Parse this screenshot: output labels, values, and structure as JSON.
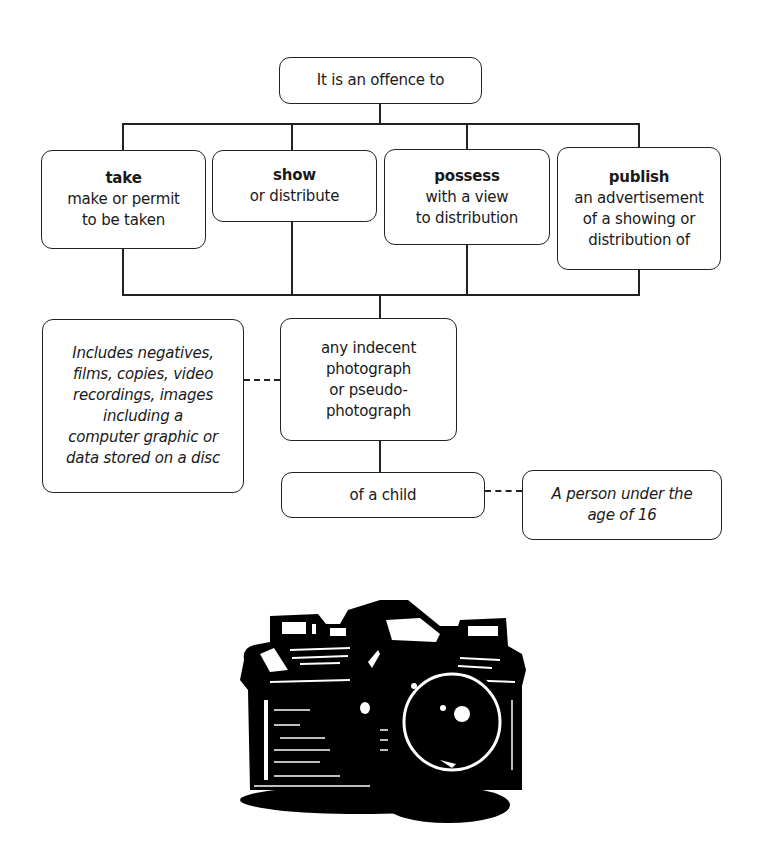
{
  "diagram": {
    "root": {
      "text": "It is an offence to"
    },
    "actions": [
      {
        "head": "take",
        "lines": [
          "make or permit",
          "to be taken"
        ]
      },
      {
        "head": "show",
        "lines": [
          "or distribute"
        ]
      },
      {
        "head": "possess",
        "lines": [
          "with a view",
          "to distribution"
        ]
      },
      {
        "head": "publish",
        "lines": [
          "an advertisement",
          "of a showing or",
          "distribution of"
        ]
      }
    ],
    "object": {
      "lines": [
        "any indecent",
        "photograph",
        "or pseudo-",
        "photograph"
      ]
    },
    "object_note": {
      "lines": [
        "Includes negatives,",
        "films, copies, video",
        "recordings, images",
        "including a",
        "computer graphic or",
        "data stored on a disc"
      ]
    },
    "subject": {
      "text": "of a child"
    },
    "subject_note": {
      "lines": [
        "A person under the",
        "age of 16"
      ]
    }
  },
  "illustration": {
    "icon": "camera-icon",
    "color": "#000000"
  }
}
